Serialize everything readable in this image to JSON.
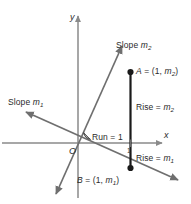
{
  "figure": {
    "background_color": "#ffffff",
    "axis_color": "#8a8a8a",
    "line_color": "#6f6f6f",
    "segment_color": "#1a1a1a",
    "text_color": "#2b2b2b"
  },
  "axes": {
    "x_label": "x",
    "y_label": "y",
    "origin_label": "O",
    "x_tick_label": "1"
  },
  "labels": {
    "slope_m2": "Slope ",
    "slope_m2_var": "m",
    "slope_m2_sub": "2",
    "slope_m1": "Slope ",
    "slope_m1_var": "m",
    "slope_m1_sub": "1",
    "point_a_prefix": "A",
    "point_a_eq": " = (1, ",
    "point_a_var": "m",
    "point_a_sub": "2",
    "point_a_close": ")",
    "point_b_prefix": "B",
    "point_b_eq": " = (1, ",
    "point_b_var": "m",
    "point_b_sub": "1",
    "point_b_close": ")",
    "rise_m2": "Rise = ",
    "rise_m2_var": "m",
    "rise_m2_sub": "2",
    "rise_m1": "Rise = ",
    "rise_m1_var": "m",
    "rise_m1_sub": "1",
    "run": "Run = 1"
  },
  "geometry": {
    "origin": [
      78,
      143
    ],
    "point_a": [
      130,
      72
    ],
    "point_b": [
      131,
      168
    ],
    "x_unit": 52,
    "right_angle_marker": true
  }
}
